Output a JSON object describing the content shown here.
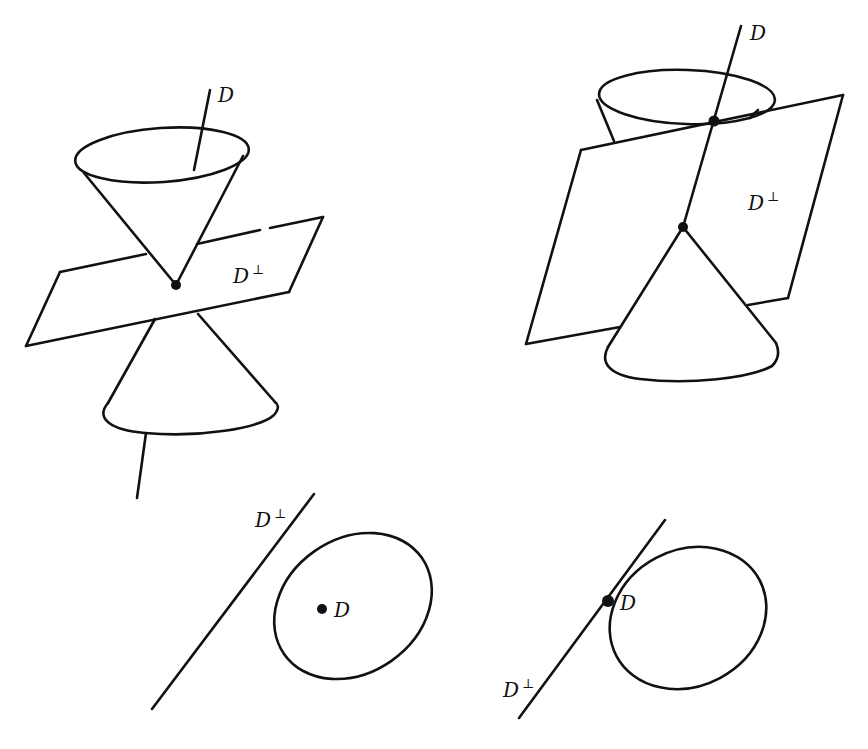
{
  "figure": {
    "colors": {
      "ink": "#111111",
      "background": "#ffffff"
    },
    "panels": [
      {
        "id": "top-left",
        "description": "Double cone with axis D, plane D-perp through vertex",
        "labels": {
          "axis": "D",
          "plane": "D",
          "plane_sup": "⊥"
        }
      },
      {
        "id": "top-right",
        "description": "Cone with vertex on axis D, plane D-perp tangent to upper cone rim",
        "labels": {
          "axis": "D",
          "plane": "D",
          "plane_sup": "⊥"
        }
      },
      {
        "id": "bottom-left",
        "description": "Projection: line D-perp separate from ellipse containing point D",
        "labels": {
          "line": "D",
          "line_sup": "⊥",
          "point": "D"
        }
      },
      {
        "id": "bottom-right",
        "description": "Projection: line D-perp tangent to ellipse at point D",
        "labels": {
          "line": "D",
          "line_sup": "⊥",
          "point": "D"
        }
      }
    ]
  }
}
